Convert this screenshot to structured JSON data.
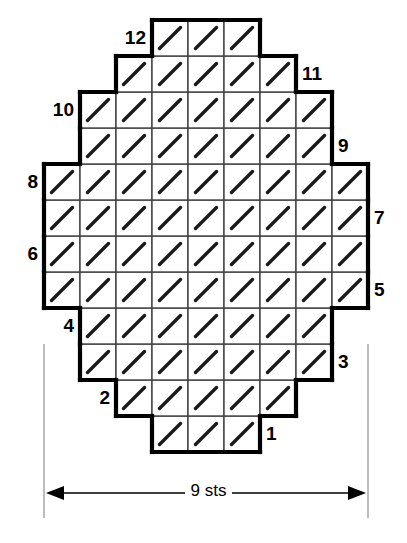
{
  "chart_data": {
    "type": "table",
    "title": "",
    "subtitle": "",
    "xlabel": "9 sts",
    "ylabel": "",
    "grid": true,
    "legend_position": "none",
    "chart_kind": "knitting-stitch-chart",
    "stitch_symbol": "/",
    "stitch_symbol_name": "slash-diagonal",
    "columns": 9,
    "rows": 12,
    "cell_size_px": 36,
    "row_numbering_direction": "bottom-to-top",
    "odd_rows_label_side": "right",
    "even_rows_label_side": "left",
    "rows_detail": [
      {
        "number": "1",
        "label_side": "right",
        "start_col": 4,
        "stitch_count": 3,
        "symbols": [
          "/",
          "/",
          "/"
        ]
      },
      {
        "number": "2",
        "label_side": "left",
        "start_col": 3,
        "stitch_count": 5,
        "symbols": [
          "/",
          "/",
          "/",
          "/",
          "/"
        ]
      },
      {
        "number": "3",
        "label_side": "right",
        "start_col": 2,
        "stitch_count": 7,
        "symbols": [
          "/",
          "/",
          "/",
          "/",
          "/",
          "/",
          "/"
        ]
      },
      {
        "number": "4",
        "label_side": "left",
        "start_col": 2,
        "stitch_count": 7,
        "symbols": [
          "/",
          "/",
          "/",
          "/",
          "/",
          "/",
          "/"
        ]
      },
      {
        "number": "5",
        "label_side": "right",
        "start_col": 1,
        "stitch_count": 9,
        "symbols": [
          "/",
          "/",
          "/",
          "/",
          "/",
          "/",
          "/",
          "/",
          "/"
        ]
      },
      {
        "number": "6",
        "label_side": "left",
        "start_col": 1,
        "stitch_count": 9,
        "symbols": [
          "/",
          "/",
          "/",
          "/",
          "/",
          "/",
          "/",
          "/",
          "/"
        ]
      },
      {
        "number": "7",
        "label_side": "right",
        "start_col": 1,
        "stitch_count": 9,
        "symbols": [
          "/",
          "/",
          "/",
          "/",
          "/",
          "/",
          "/",
          "/",
          "/"
        ]
      },
      {
        "number": "8",
        "label_side": "left",
        "start_col": 1,
        "stitch_count": 9,
        "symbols": [
          "/",
          "/",
          "/",
          "/",
          "/",
          "/",
          "/",
          "/",
          "/"
        ]
      },
      {
        "number": "9",
        "label_side": "right",
        "start_col": 2,
        "stitch_count": 7,
        "symbols": [
          "/",
          "/",
          "/",
          "/",
          "/",
          "/",
          "/"
        ]
      },
      {
        "number": "10",
        "label_side": "left",
        "start_col": 2,
        "stitch_count": 7,
        "symbols": [
          "/",
          "/",
          "/",
          "/",
          "/",
          "/",
          "/"
        ]
      },
      {
        "number": "11",
        "label_side": "right",
        "start_col": 3,
        "stitch_count": 5,
        "symbols": [
          "/",
          "/",
          "/",
          "/",
          "/"
        ]
      },
      {
        "number": "12",
        "label_side": "left",
        "start_col": 4,
        "stitch_count": 3,
        "symbols": [
          "/",
          "/",
          "/"
        ]
      }
    ],
    "total_stitches_charted": 78,
    "colors": {
      "outline": "#000000",
      "gridline": "#404040",
      "symbol": "#1a1a1a",
      "background": "#ffffff",
      "dimension_line": "#000000",
      "extension_line": "#9a9a9a"
    }
  },
  "dimension": {
    "width_label": "9 sts",
    "arrow_left_name": "arrow-left",
    "arrow_right_name": "arrow-right"
  },
  "row_labels": {
    "r1": "1",
    "r2": "2",
    "r3": "3",
    "r4": "4",
    "r5": "5",
    "r6": "6",
    "r7": "7",
    "r8": "8",
    "r9": "9",
    "r10": "10",
    "r11": "11",
    "r12": "12"
  }
}
